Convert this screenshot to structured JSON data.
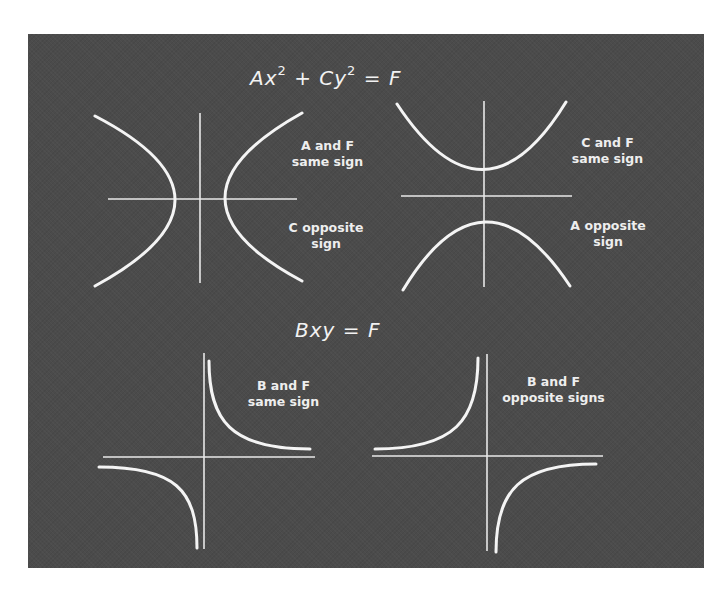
{
  "panel": {
    "background": "#4b4b4b",
    "foreground": "#f2f2f2"
  },
  "equations": {
    "top": {
      "A": "A",
      "x": "x",
      "exp1": "2",
      "plus": "+",
      "C": "C",
      "y": "y",
      "exp2": "2",
      "eq": "=",
      "F": "F",
      "full": "Ax² + Cy² = F"
    },
    "bottom": {
      "B": "B",
      "xy": "xy",
      "eq": "=",
      "F": "F",
      "full": "Bxy = F"
    }
  },
  "diagrams": [
    {
      "id": "horizontal-hyperbola",
      "equation": "Ax² + Cy² = F",
      "labels": [
        {
          "line1": "A and F",
          "line2": "same sign"
        },
        {
          "line1": "C opposite",
          "line2": "sign"
        }
      ]
    },
    {
      "id": "vertical-hyperbola",
      "equation": "Ax² + Cy² = F",
      "labels": [
        {
          "line1": "C and F",
          "line2": "same sign"
        },
        {
          "line1": "A opposite",
          "line2": "sign"
        }
      ]
    },
    {
      "id": "rectangular-hyperbola-quadrants-1-3",
      "equation": "Bxy = F",
      "labels": [
        {
          "line1": "B and F",
          "line2": "same sign"
        }
      ]
    },
    {
      "id": "rectangular-hyperbola-quadrants-2-4",
      "equation": "Bxy = F",
      "labels": [
        {
          "line1": "B and F",
          "line2": "opposite signs"
        }
      ]
    }
  ]
}
